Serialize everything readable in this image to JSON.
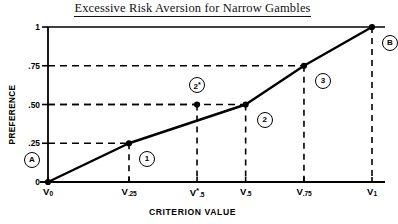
{
  "chart_data": {
    "type": "line",
    "title": "Excessive Risk Aversion for Narrow Gambles",
    "xlabel": "CRITERION VALUE",
    "ylabel": "PREFERENCE",
    "xlim": [
      0,
      1
    ],
    "ylim": [
      0,
      1
    ],
    "grid": "dashed guide lines to each labeled point",
    "legend": "none",
    "x_ticks": [
      {
        "value": 0.0,
        "base": "V",
        "sub": "0",
        "star": false
      },
      {
        "value": 0.25,
        "base": "V",
        "sub": ".25",
        "star": false
      },
      {
        "value": 0.46,
        "base": "V",
        "sub": ".5",
        "star": true
      },
      {
        "value": 0.61,
        "base": "V",
        "sub": ".5",
        "star": false
      },
      {
        "value": 0.79,
        "base": "V",
        "sub": ".75",
        "star": false
      },
      {
        "value": 1.0,
        "base": "V",
        "sub": "1",
        "star": false
      }
    ],
    "y_ticks": [
      {
        "value": 0.0,
        "label": "0"
      },
      {
        "value": 0.25,
        "label": ".25"
      },
      {
        "value": 0.5,
        "label": ".50"
      },
      {
        "value": 0.75,
        "label": ".75"
      },
      {
        "value": 1.0,
        "label": "1"
      }
    ],
    "series": [
      {
        "name": "preference curve",
        "points": [
          {
            "label": "A",
            "x": 0.0,
            "y": 0.0
          },
          {
            "label": "1",
            "x": 0.25,
            "y": 0.25
          },
          {
            "label": "2",
            "x": 0.61,
            "y": 0.5
          },
          {
            "label": "3",
            "x": 0.79,
            "y": 0.75
          },
          {
            "label": "B",
            "x": 1.0,
            "y": 1.0
          }
        ]
      },
      {
        "name": "off-curve point",
        "points": [
          {
            "label": "2*",
            "x": 0.46,
            "y": 0.5
          }
        ]
      }
    ],
    "annotations": [
      {
        "text": "A",
        "x": 0.0,
        "y": 0.0,
        "dx": -16,
        "dy": -22
      },
      {
        "text": "1",
        "x": 0.25,
        "y": 0.25,
        "dx": 18,
        "dy": 16
      },
      {
        "text": "2*",
        "x": 0.46,
        "y": 0.5,
        "dx": 0,
        "dy": -20
      },
      {
        "text": "2",
        "x": 0.61,
        "y": 0.5,
        "dx": 19,
        "dy": 15
      },
      {
        "text": "3",
        "x": 0.79,
        "y": 0.75,
        "dx": 19,
        "dy": 15
      },
      {
        "text": "B",
        "x": 1.0,
        "y": 1.0,
        "dx": 18,
        "dy": 16
      }
    ],
    "colors": {
      "line": "#000000",
      "marker": "#000000",
      "axis": "#000000",
      "grid": "#000000",
      "background": "#ffffff"
    }
  }
}
